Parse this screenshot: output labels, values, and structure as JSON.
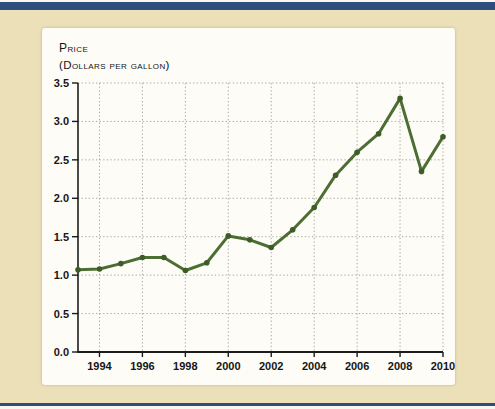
{
  "colors": {
    "accent_bar": "#2e4d7c",
    "background": "#ece0b8",
    "panel": "#fdfcf7",
    "grid": "#a6a69a",
    "axis": "#1c1c1c",
    "line": "#4d6e33",
    "marker": "#3d5c28"
  },
  "header": {
    "title_line1": "Price",
    "title_line2": "(Dollars per gallon)"
  },
  "chart_data": {
    "type": "line",
    "title": "Price (dollars per gallon)",
    "ylabel": "Price (dollars per gallon)",
    "x": [
      1993,
      1994,
      1995,
      1996,
      1997,
      1998,
      1999,
      2000,
      2001,
      2002,
      2003,
      2004,
      2005,
      2006,
      2007,
      2008,
      2009,
      2010
    ],
    "values": [
      1.07,
      1.08,
      1.15,
      1.23,
      1.23,
      1.06,
      1.16,
      1.51,
      1.46,
      1.36,
      1.59,
      1.88,
      2.3,
      2.6,
      2.84,
      3.3,
      2.35,
      2.8
    ],
    "xlim": [
      1993,
      2010
    ],
    "ylim": [
      0,
      3.5
    ],
    "xtick_labels": [
      "1994",
      "1996",
      "1998",
      "2000",
      "2002",
      "2004",
      "2006",
      "2008",
      "2010"
    ],
    "ytick_labels": [
      "0.0",
      "0.5",
      "1.0",
      "1.5",
      "2.0",
      "2.5",
      "3.0",
      "3.5"
    ],
    "grid": "dotted",
    "legend": "none",
    "line_color": "#4d6e33",
    "marker_color": "#3d5c28"
  }
}
